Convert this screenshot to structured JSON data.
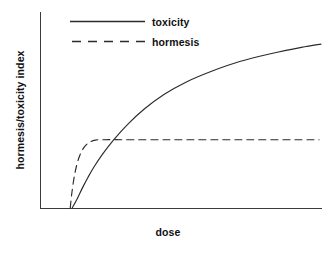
{
  "chart_data": {
    "type": "line",
    "title": "",
    "subtitle": "",
    "xlabel": "dose",
    "ylabel": "hormesis/toxicity index",
    "xlim": [
      0,
      100
    ],
    "ylim": [
      0,
      100
    ],
    "grid": false,
    "x_tick_labels": [],
    "y_tick_labels": [],
    "legend_position": "top-left-inside",
    "annotations": [],
    "series": [
      {
        "name": "toxicity",
        "style": "solid",
        "color": "#2b2b2b",
        "x": [
          11.3,
          13.0,
          15.0,
          17.0,
          19.0,
          22.0,
          26.0,
          31.0,
          37.0,
          44.0,
          52.0,
          61.0,
          71.0,
          82.0,
          93.0,
          100.0
        ],
        "y": [
          0.0,
          4.5,
          10.5,
          16.0,
          21.0,
          27.5,
          35.0,
          43.0,
          51.0,
          58.5,
          65.0,
          70.5,
          75.5,
          79.5,
          82.8,
          84.5
        ]
      },
      {
        "name": "hormesis",
        "style": "dashed",
        "color": "#2b2b2b",
        "x": [
          10.6,
          11.2,
          12.2,
          13.6,
          15.4,
          17.4,
          19.6,
          22.0,
          30.0,
          45.0,
          60.0,
          75.0,
          90.0,
          99.3
        ],
        "y": [
          0.0,
          8.0,
          17.5,
          25.5,
          31.0,
          33.8,
          35.0,
          35.2,
          35.2,
          35.2,
          35.2,
          35.2,
          35.2,
          35.2
        ]
      }
    ]
  },
  "legend": {
    "items": [
      {
        "label": "toxicity",
        "style": "solid"
      },
      {
        "label": "hormesis",
        "style": "dashed"
      }
    ]
  },
  "axes": {
    "x_label": "dose",
    "y_label": "hormesis/toxicity index"
  },
  "colors": {
    "background": "#ffffff",
    "axis": "#3a3a3a",
    "line": "#2b2b2b",
    "text": "#111111"
  }
}
